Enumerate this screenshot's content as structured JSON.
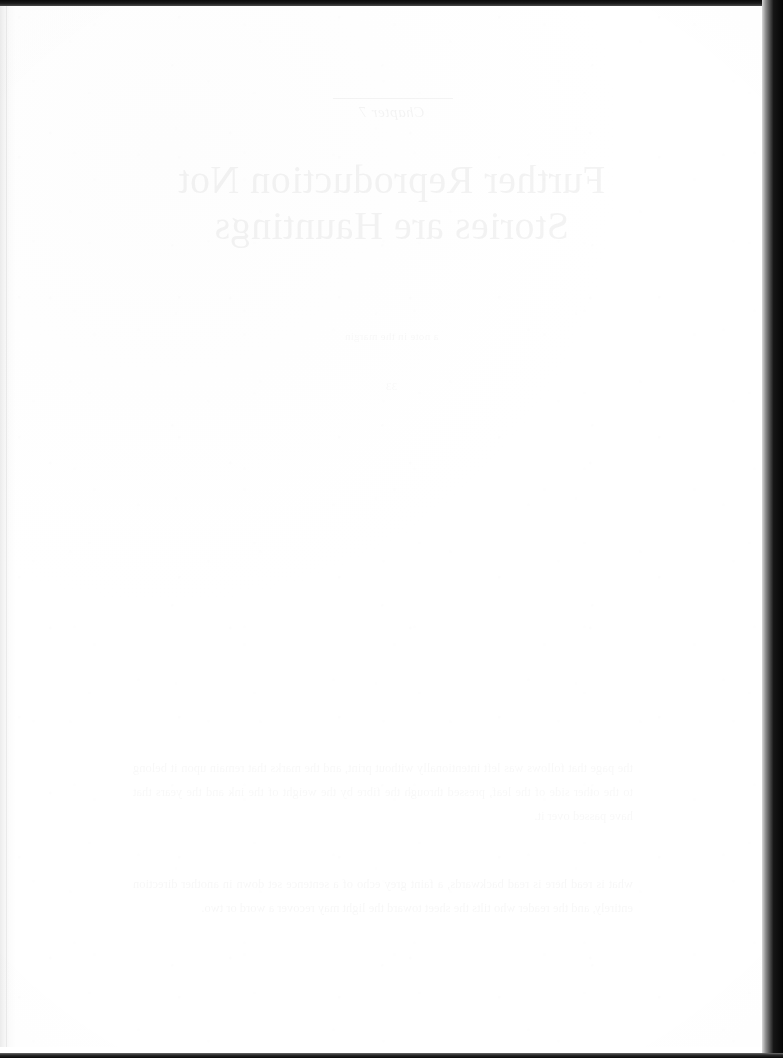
{
  "page": {
    "kind": "scanned-book-page",
    "surface": "blank verso leaf",
    "paper_color": "#fefefe",
    "scan_border_color": "#0a0a0a",
    "width_px": 783,
    "height_px": 1058
  },
  "bleed_through": {
    "note": "mirrored show-through text from the reverse side of the leaf",
    "kicker": "Chapter 7",
    "title_line_1": "Further Reproduction Not",
    "title_line_2": "Stories are Hauntings",
    "mid_note": "a note in the margin",
    "mid_note_2": "33",
    "paragraph": "the page that follows was left intentionally without print, and the marks that remain upon it belong to the other side of the leaf, pressed through the fibre by the weight of the ink and the years that have passed over it.",
    "paragraph_2": "what is read here is read backwards, a faint grey echo of a sentence set down in another direction entirely, and the reader who tilts the sheet toward the light may recover a word or two."
  }
}
